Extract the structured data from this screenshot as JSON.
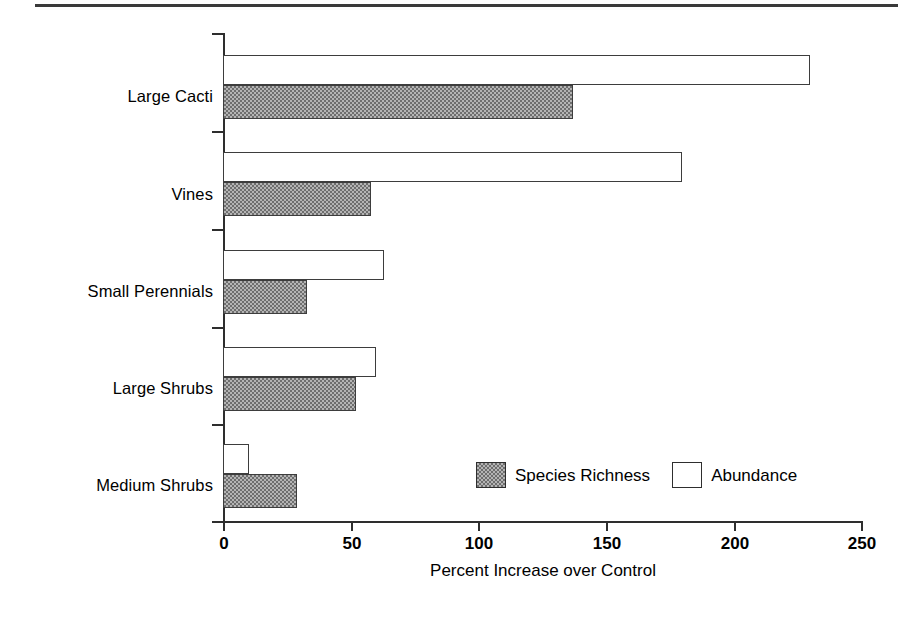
{
  "chart_data": {
    "type": "bar",
    "orientation": "horizontal",
    "title": "",
    "xlabel": "Percent Increase over Control",
    "ylabel": "",
    "xlim": [
      0,
      250
    ],
    "xticks": [
      "0",
      "50",
      "100",
      "150",
      "200",
      "250"
    ],
    "grid": false,
    "legend_position": "inside-lower-right",
    "categories": [
      "Large Cacti",
      "Vines",
      "Small Perennials",
      "Large Shrubs",
      "Medium Shrubs"
    ],
    "series": [
      {
        "name": "Abundance",
        "fill": "white",
        "color": "#ffffff",
        "values": [
          230,
          180,
          63,
          60,
          10
        ]
      },
      {
        "name": "Species Richness",
        "fill": "hatched-grey",
        "color": "#b4b4b4",
        "values": [
          137,
          58,
          33,
          52,
          29
        ]
      }
    ]
  },
  "legend": {
    "entries": [
      {
        "label": "Species Richness",
        "swatch": "richness"
      },
      {
        "label": "Abundance",
        "swatch": "abundance"
      }
    ]
  },
  "axis": {
    "x_title": "Percent Increase over Control"
  },
  "colors": {
    "axis": "#2e2e2e",
    "bar_border": "#3d3d3d",
    "richness_fill": "#b4b4b4",
    "abundance_fill": "#ffffff",
    "rule": "#3a3a3a"
  }
}
